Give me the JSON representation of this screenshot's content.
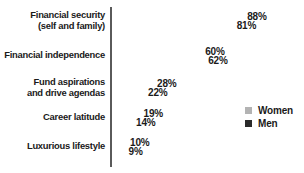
{
  "chart_data": {
    "type": "bar",
    "orientation": "horizontal",
    "title": "",
    "subtitle": "",
    "xlabel": "",
    "ylabel": "",
    "grid": false,
    "xlim": [
      0,
      88
    ],
    "legend_position": "right",
    "value_suffix": "%",
    "categories": [
      "Financial security\n(self and family)",
      "Financial independence",
      "Fund aspirations\nand drive agendas",
      "Career latitude",
      "Luxurious lifestyle"
    ],
    "series": [
      {
        "name": "Women",
        "color": "#b3b3b3",
        "values": [
          88,
          60,
          28,
          19,
          10
        ],
        "labels": [
          "88%",
          "60%",
          "28%",
          "19%",
          "10%"
        ]
      },
      {
        "name": "Men",
        "color": "#2b2b2b",
        "values": [
          81,
          62,
          22,
          14,
          9
        ],
        "labels": [
          "81%",
          "62%",
          "22%",
          "14%",
          "9%"
        ]
      }
    ]
  },
  "axis": {
    "color": "#5a5a5a"
  },
  "legend": {
    "items": [
      {
        "label": "Women",
        "color": "#b3b3b3"
      },
      {
        "label": "Men",
        "color": "#2b2b2b"
      }
    ]
  }
}
